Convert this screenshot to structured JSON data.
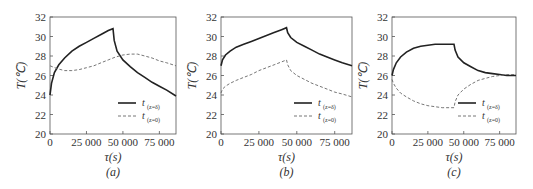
{
  "chart_data": [
    {
      "type": "line",
      "panel_label": "(a)",
      "xlabel": "τ(s)",
      "ylabel": "T(℃)",
      "xlim": [
        0,
        86400
      ],
      "ylim": [
        20,
        32
      ],
      "xticks": [
        0,
        25000,
        50000,
        75000
      ],
      "xtick_labels": [
        "0",
        "25 000",
        "50 000",
        "75 000"
      ],
      "yticks": [
        20,
        22,
        24,
        26,
        28,
        30,
        32
      ],
      "ytick_labels": [
        "20",
        "22",
        "24",
        "26",
        "28",
        "30",
        "32"
      ],
      "legend_position": "bottom-right",
      "series": [
        {
          "name": "t(z=δ)",
          "label_main": "t",
          "label_sub": "(z=δ)",
          "style": "solid",
          "x": [
            0,
            1000,
            3000,
            6000,
            10000,
            15000,
            20000,
            25000,
            30000,
            35000,
            40000,
            43200,
            44000,
            46000,
            50000,
            55000,
            60000,
            65000,
            70000,
            75000,
            80000,
            86400
          ],
          "y": [
            24.0,
            25.2,
            26.3,
            27.1,
            27.8,
            28.5,
            29.0,
            29.4,
            29.8,
            30.2,
            30.6,
            30.8,
            29.6,
            28.5,
            27.6,
            26.9,
            26.3,
            25.8,
            25.3,
            24.9,
            24.5,
            23.9
          ]
        },
        {
          "name": "t(z=0)",
          "label_main": "t",
          "label_sub": "(z=0)",
          "style": "dashed",
          "x": [
            0,
            5000,
            10000,
            15000,
            20000,
            25000,
            30000,
            35000,
            40000,
            45000,
            50000,
            55000,
            60000,
            65000,
            70000,
            75000,
            80000,
            86400
          ],
          "y": [
            27.0,
            26.7,
            26.5,
            26.5,
            26.6,
            26.8,
            27.0,
            27.3,
            27.6,
            27.9,
            28.1,
            28.2,
            28.2,
            28.0,
            27.8,
            27.5,
            27.3,
            27.0
          ]
        }
      ]
    },
    {
      "type": "line",
      "panel_label": "(b)",
      "xlabel": "τ(s)",
      "ylabel": "T(℃)",
      "xlim": [
        0,
        86400
      ],
      "ylim": [
        20,
        32
      ],
      "xticks": [
        0,
        25000,
        50000,
        75000
      ],
      "xtick_labels": [
        "0",
        "25 000",
        "50 000",
        "75 000"
      ],
      "yticks": [
        20,
        22,
        24,
        26,
        28,
        30,
        32
      ],
      "ytick_labels": [
        "20",
        "22",
        "24",
        "26",
        "28",
        "30",
        "32"
      ],
      "legend_position": "bottom-right",
      "series": [
        {
          "name": "t(z=δ)",
          "label_main": "t",
          "label_sub": "(z=δ)",
          "style": "solid",
          "x": [
            0,
            1000,
            3000,
            6000,
            10000,
            15000,
            20000,
            25000,
            30000,
            35000,
            40000,
            43200,
            44000,
            46000,
            50000,
            55000,
            60000,
            65000,
            70000,
            75000,
            80000,
            86400
          ],
          "y": [
            27.0,
            27.6,
            28.1,
            28.5,
            28.9,
            29.2,
            29.5,
            29.8,
            30.1,
            30.4,
            30.7,
            30.9,
            30.4,
            29.9,
            29.4,
            29.0,
            28.6,
            28.2,
            27.9,
            27.6,
            27.3,
            27.0
          ]
        },
        {
          "name": "t(z=0)",
          "label_main": "t",
          "label_sub": "(z=0)",
          "style": "dashed",
          "x": [
            0,
            1000,
            3000,
            6000,
            10000,
            15000,
            20000,
            25000,
            30000,
            35000,
            40000,
            43200,
            44000,
            46000,
            50000,
            55000,
            60000,
            65000,
            70000,
            75000,
            80000,
            86400
          ],
          "y": [
            24.2,
            24.6,
            24.9,
            25.2,
            25.5,
            25.8,
            26.1,
            26.5,
            26.8,
            27.1,
            27.4,
            27.6,
            27.1,
            26.5,
            26.0,
            25.6,
            25.2,
            24.9,
            24.6,
            24.3,
            24.1,
            23.8
          ]
        }
      ]
    },
    {
      "type": "line",
      "panel_label": "(c)",
      "xlabel": "τ(s)",
      "ylabel": "T(℃)",
      "xlim": [
        0,
        86400
      ],
      "ylim": [
        20,
        32
      ],
      "xticks": [
        0,
        25000,
        50000,
        75000
      ],
      "xtick_labels": [
        "0",
        "25 000",
        "50 000",
        "75 000"
      ],
      "yticks": [
        20,
        22,
        24,
        26,
        28,
        30,
        32
      ],
      "ytick_labels": [
        "20",
        "22",
        "24",
        "26",
        "28",
        "30",
        "32"
      ],
      "legend_position": "bottom-right",
      "series": [
        {
          "name": "t(z=δ)",
          "label_main": "t",
          "label_sub": "(z=δ)",
          "style": "solid",
          "x": [
            0,
            1000,
            3000,
            6000,
            10000,
            15000,
            20000,
            25000,
            30000,
            35000,
            40000,
            43200,
            44000,
            46000,
            50000,
            55000,
            60000,
            65000,
            70000,
            75000,
            80000,
            86400
          ],
          "y": [
            26.0,
            26.6,
            27.3,
            27.9,
            28.4,
            28.8,
            29.0,
            29.1,
            29.2,
            29.2,
            29.2,
            29.2,
            28.6,
            27.9,
            27.3,
            26.9,
            26.5,
            26.3,
            26.2,
            26.1,
            26.0,
            26.0
          ]
        },
        {
          "name": "t(z=0)",
          "label_main": "t",
          "label_sub": "(z=0)",
          "style": "dashed",
          "x": [
            0,
            1000,
            3000,
            6000,
            10000,
            15000,
            20000,
            25000,
            30000,
            35000,
            40000,
            43200,
            44000,
            46000,
            50000,
            55000,
            60000,
            65000,
            70000,
            75000,
            80000,
            86400
          ],
          "y": [
            25.6,
            25.2,
            24.7,
            24.2,
            23.8,
            23.4,
            23.1,
            22.9,
            22.8,
            22.7,
            22.7,
            22.7,
            23.3,
            24.0,
            24.6,
            25.1,
            25.5,
            25.7,
            25.9,
            26.0,
            26.1,
            26.1
          ]
        }
      ]
    }
  ]
}
